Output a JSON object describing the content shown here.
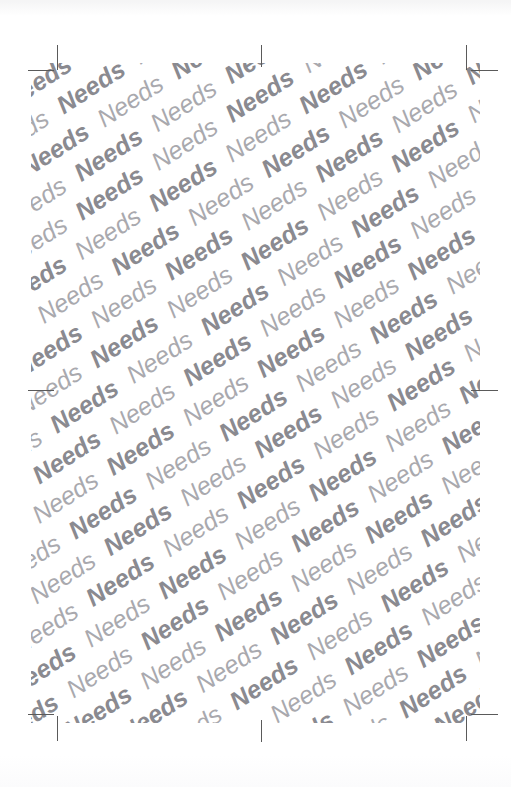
{
  "page": {
    "width": 511,
    "height": 787,
    "background_color": "#ffffff",
    "kind": "scanned-page-with-watermark"
  },
  "watermark": {
    "text": "Needs",
    "repeat_count_per_row": 18,
    "row_count": 36,
    "rotation_degrees": -33,
    "font_size_px": 25,
    "style": "italic",
    "weight_pattern": [
      "bold",
      "regular"
    ],
    "color_bold": "#8a8a90",
    "color_regular": "#a9a9ae",
    "clip_region": {
      "left": 31,
      "top": 63,
      "width": 449,
      "height": 660
    }
  },
  "crop_marks": {
    "color": "#5a5a5a",
    "line_width_px": 1,
    "items": [
      {
        "name": "top-left-vertical",
        "orientation": "vertical",
        "x": 57,
        "y": 45,
        "length": 25
      },
      {
        "name": "top-left-horizontal",
        "orientation": "horizontal",
        "x": 28,
        "y": 70,
        "length": 26
      },
      {
        "name": "top-right-vertical",
        "orientation": "vertical",
        "x": 466,
        "y": 45,
        "length": 25
      },
      {
        "name": "top-right-horizontal",
        "orientation": "horizontal",
        "x": 471,
        "y": 70,
        "length": 27
      },
      {
        "name": "bottom-left-vertical",
        "orientation": "vertical",
        "x": 57,
        "y": 716,
        "length": 25
      },
      {
        "name": "bottom-left-horizontal",
        "orientation": "horizontal",
        "x": 28,
        "y": 714,
        "length": 26
      },
      {
        "name": "bottom-right-vertical",
        "orientation": "vertical",
        "x": 466,
        "y": 716,
        "length": 25
      },
      {
        "name": "bottom-right-horizontal",
        "orientation": "horizontal",
        "x": 471,
        "y": 714,
        "length": 27
      },
      {
        "name": "top-center-tick",
        "orientation": "vertical",
        "x": 261,
        "y": 45,
        "length": 22
      },
      {
        "name": "bottom-center-tick",
        "orientation": "vertical",
        "x": 261,
        "y": 720,
        "length": 22
      },
      {
        "name": "left-center-tick",
        "orientation": "horizontal",
        "x": 28,
        "y": 390,
        "length": 26
      },
      {
        "name": "right-center-tick",
        "orientation": "horizontal",
        "x": 471,
        "y": 390,
        "length": 27
      }
    ]
  }
}
